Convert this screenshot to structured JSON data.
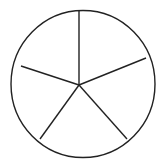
{
  "diagram": {
    "type": "circle-divided-into-equal-sectors",
    "sector_count": 5,
    "colors": {
      "stroke": "#222222",
      "fill": "#ffffff"
    },
    "circle": {
      "cx": 83,
      "cy": 84,
      "rx": 72,
      "ry": 73.5
    },
    "center": {
      "x": 79,
      "y": 85
    },
    "spokes": [
      {
        "x": 79,
        "y": 10
      },
      {
        "x": 146,
        "y": 58
      },
      {
        "x": 127,
        "y": 139
      },
      {
        "x": 40,
        "y": 139
      },
      {
        "x": 21,
        "y": 66
      }
    ]
  }
}
